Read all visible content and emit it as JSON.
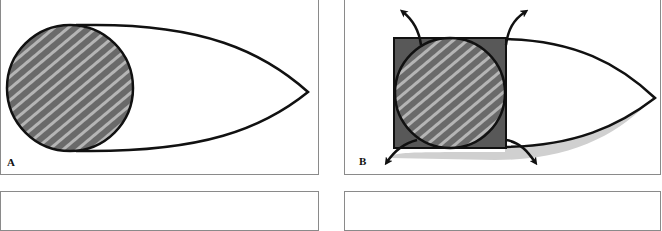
{
  "figure": {
    "panels": [
      {
        "id": "A",
        "label": "A",
        "description": "Circular hatched cross-section inside a teardrop/leaf-shaped outline"
      },
      {
        "id": "B",
        "label": "B",
        "description": "Circle inscribed in dark square with four curved arrows pointing outward from corners; teardrop outline with grey shadow"
      },
      {
        "id": "C",
        "label": ""
      },
      {
        "id": "D",
        "label": ""
      }
    ],
    "colors": {
      "outline": "#111111",
      "hatch_fill": "#6a6a6a",
      "hatch_stripe": "#b8b8b8",
      "square_fill": "#585858",
      "shadow": "#cfcfcf",
      "panel_border": "#8a8a8a"
    }
  }
}
